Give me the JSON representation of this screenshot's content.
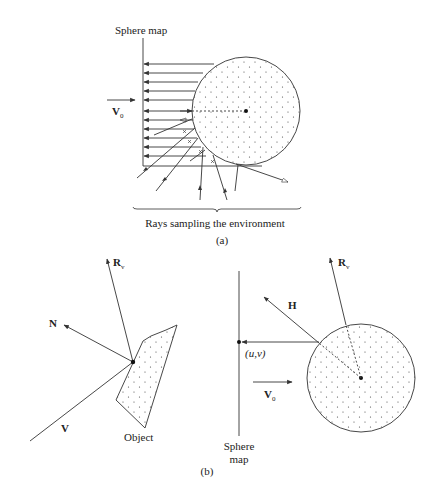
{
  "panel_a": {
    "sphere_map_label": "Sphere map",
    "view_vector": {
      "symbol": "V",
      "subscript": "0"
    },
    "caption": "Rays sampling the environment",
    "panel_label": "(a)"
  },
  "panel_b": {
    "left": {
      "reflection_vector": {
        "symbol": "R",
        "subscript": "v"
      },
      "normal_vector": {
        "symbol": "N"
      },
      "view_vector": {
        "symbol": "V"
      },
      "object_label": "Object"
    },
    "right": {
      "reflection_vector": {
        "symbol": "R",
        "subscript": "v"
      },
      "halfway_vector": {
        "symbol": "H"
      },
      "uv_label": "(u,v)",
      "view_vector": {
        "symbol": "V",
        "subscript": "0"
      },
      "sphere_map_label_line1": "Sphere",
      "sphere_map_label_line2": "map"
    },
    "panel_label": "(b)"
  },
  "colors": {
    "line": "#333333",
    "background": "#ffffff"
  }
}
